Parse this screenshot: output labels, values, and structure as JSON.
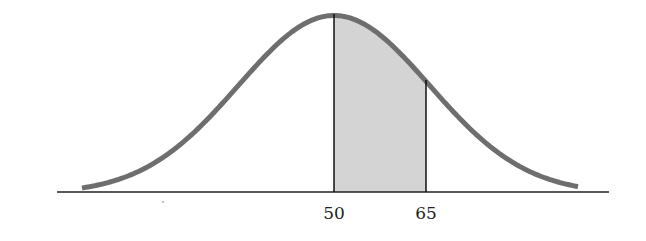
{
  "chart_data": {
    "type": "area",
    "title": "",
    "distribution": {
      "mean": 50,
      "sd_approx": 15.6
    },
    "shaded_region": {
      "from": 50,
      "to": 65
    },
    "x_tick_labels": [
      "50",
      "65"
    ],
    "xlabel": "",
    "ylabel": "",
    "grid": false,
    "legend": null
  },
  "colors": {
    "curve": "#6e6e6e",
    "shade": "#d4d4d4",
    "axis": "#222222"
  },
  "labels": {
    "mean": "50",
    "upper": "65"
  }
}
